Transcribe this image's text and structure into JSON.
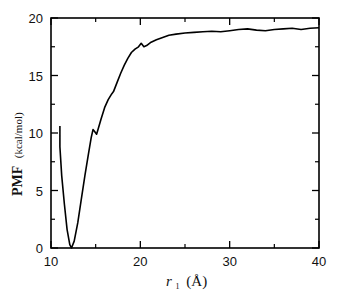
{
  "chart_data": {
    "type": "line",
    "title": "",
    "xlabel": "r1 (Å)",
    "xlabel_parts": {
      "symbol": "r",
      "subscript": "1",
      "unit": "(Å)"
    },
    "ylabel": "PMF (kcal/mol)",
    "ylabel_parts": {
      "main": "PMF",
      "unit": "(kcal/mol)"
    },
    "xlim": [
      10,
      40
    ],
    "ylim": [
      0,
      20
    ],
    "x_ticks": [
      10,
      20,
      30,
      40
    ],
    "x_minor_ticks": [
      15,
      25,
      35
    ],
    "y_ticks": [
      0,
      5,
      10,
      15,
      20
    ],
    "y_minor_ticks": [
      2.5,
      7.5,
      12.5,
      17.5
    ],
    "grid": false,
    "legend": null,
    "color": "#000000",
    "series": [
      {
        "name": "PMF",
        "x": [
          11.0,
          11.0,
          11.2,
          11.5,
          11.8,
          12.1,
          12.3,
          12.6,
          13.0,
          13.4,
          13.8,
          14.2,
          14.5,
          14.7,
          14.9,
          15.1,
          15.3,
          15.6,
          16.0,
          16.4,
          16.8,
          17.0,
          17.4,
          17.8,
          18.2,
          18.6,
          19.0,
          19.4,
          19.8,
          20.1,
          20.4,
          20.7,
          21.2,
          21.8,
          22.5,
          23.2,
          24.0,
          25.0,
          26.0,
          27.0,
          28.0,
          29.0,
          30.0,
          31.0,
          32.0,
          33.0,
          34.0,
          35.0,
          36.0,
          37.0,
          38.0,
          39.0,
          40.0
        ],
        "values": [
          10.6,
          8.8,
          6.3,
          3.8,
          1.6,
          0.3,
          0.0,
          0.6,
          2.2,
          4.3,
          6.3,
          8.2,
          9.6,
          10.3,
          10.1,
          9.9,
          10.4,
          11.2,
          12.2,
          12.9,
          13.4,
          13.6,
          14.4,
          15.2,
          15.9,
          16.5,
          17.0,
          17.3,
          17.5,
          17.8,
          17.5,
          17.6,
          17.9,
          18.1,
          18.3,
          18.5,
          18.6,
          18.7,
          18.75,
          18.8,
          18.85,
          18.8,
          18.9,
          19.0,
          19.05,
          18.95,
          18.9,
          19.0,
          19.05,
          19.1,
          19.0,
          19.1,
          19.15
        ]
      }
    ]
  }
}
